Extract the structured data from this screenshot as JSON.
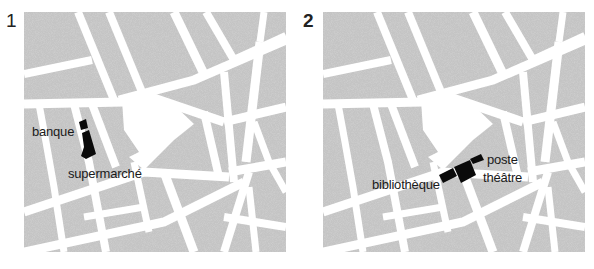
{
  "maps": [
    {
      "number": "1",
      "labels": [
        {
          "text": "banque",
          "x": 32,
          "y": 124
        },
        {
          "text": "supermarché",
          "x": 68,
          "y": 166
        }
      ],
      "buildings": [
        "banque",
        "supermarché"
      ]
    },
    {
      "number": "2",
      "labels": [
        {
          "text": "poste",
          "x": 487,
          "y": 152
        },
        {
          "text": "théâtre",
          "x": 483,
          "y": 170
        },
        {
          "text": "bibliothèque",
          "x": 372,
          "y": 177
        }
      ],
      "buildings": [
        "poste",
        "théâtre",
        "bibliothèque"
      ]
    }
  ],
  "colors": {
    "block_fill": "#b8b8b8",
    "road": "#ffffff",
    "building": "#0a0a0a",
    "outline": "#2a2a2a"
  }
}
